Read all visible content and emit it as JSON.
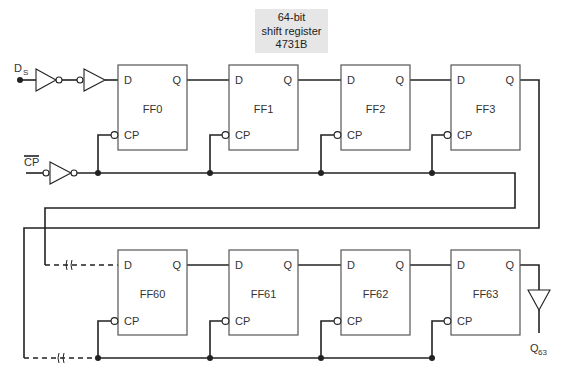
{
  "title": {
    "lines": [
      "64-bit",
      "shift register",
      "4731B"
    ]
  },
  "inputs": {
    "data_input": "D",
    "data_input_sub": "S",
    "clock_input": "CP",
    "clock_input_overbar": true
  },
  "output": {
    "label": "Q",
    "label_sub": "63"
  },
  "flipflops": [
    {
      "name": "FF0",
      "d": "D",
      "q": "Q",
      "cp": "CP"
    },
    {
      "name": "FF1",
      "d": "D",
      "q": "Q",
      "cp": "CP"
    },
    {
      "name": "FF2",
      "d": "D",
      "q": "Q",
      "cp": "CP"
    },
    {
      "name": "FF3",
      "d": "D",
      "q": "Q",
      "cp": "CP"
    },
    {
      "name": "FF60",
      "d": "D",
      "q": "Q",
      "cp": "CP"
    },
    {
      "name": "FF61",
      "d": "D",
      "q": "Q",
      "cp": "CP"
    },
    {
      "name": "FF62",
      "d": "D",
      "q": "Q",
      "cp": "CP"
    },
    {
      "name": "FF63",
      "d": "D",
      "q": "Q",
      "cp": "CP"
    }
  ],
  "colors": {
    "line": "#222222",
    "box_border": "#555555",
    "title_bg": "#e6e6e6"
  }
}
